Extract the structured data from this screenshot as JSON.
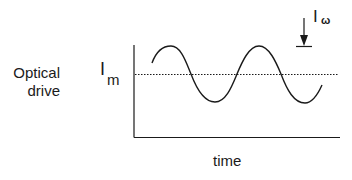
{
  "diagram": {
    "type": "optical drive modulation waveform",
    "y_axis_label_line1": "Optical",
    "y_axis_label_line2": "drive",
    "x_axis_label": "time",
    "mean_level_label": {
      "main": "I",
      "subscript": "m"
    },
    "amplitude_label": {
      "main": "I",
      "subscript": "ω"
    },
    "waveform": "sinusoid",
    "cycles_shown": 2,
    "mean_line_style": "dotted",
    "colors": {
      "line": "#1a1a1a",
      "background": "#ffffff"
    }
  }
}
